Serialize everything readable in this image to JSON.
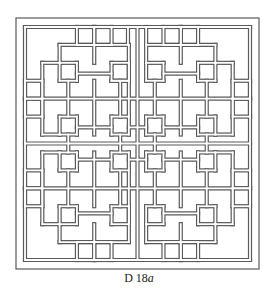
{
  "figure": {
    "caption_prefix": "D 18",
    "caption_suffix": "a",
    "stroke_color": "#5a5a5a",
    "background": "#ffffff"
  },
  "lattice": {
    "grid_size": 13,
    "origin": [
      25,
      27
    ],
    "cell": 17.3,
    "outer_frame": [
      16,
      18,
      259,
      269
    ],
    "inner_frame": [
      25,
      27,
      250,
      260
    ]
  }
}
